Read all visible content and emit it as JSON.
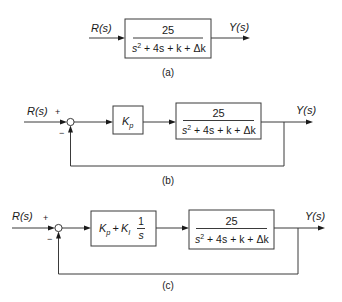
{
  "figure": {
    "panels": [
      {
        "id": "a",
        "caption": "(a)",
        "input_label": "R(s)",
        "output_label": "Y(s)",
        "plant": {
          "numerator": "25",
          "denominator": "s² + 4s + k + Δk"
        }
      },
      {
        "id": "b",
        "caption": "(b)",
        "input_label": "R(s)",
        "output_label": "Y(s)",
        "sum_signs": {
          "plus": "+",
          "minus": "−"
        },
        "controller": {
          "label": "Kp",
          "base": "K",
          "sub": "p"
        },
        "plant": {
          "numerator": "25",
          "denominator": "s² + 4s + k + Δk"
        }
      },
      {
        "id": "c",
        "caption": "(c)",
        "input_label": "R(s)",
        "output_label": "Y(s)",
        "sum_signs": {
          "plus": "+",
          "minus": "−"
        },
        "controller": {
          "label": "Kp + Ki 1/s",
          "kp_base": "K",
          "kp_sub": "p",
          "plus": "+",
          "ki_base": "K",
          "ki_sub": "I",
          "frac_num": "1",
          "frac_den": "s"
        },
        "plant": {
          "numerator": "25",
          "denominator": "s² + 4s + k + Δk"
        }
      }
    ]
  },
  "den_parts": {
    "s": "s",
    "sup": "2",
    "rest": " + 4s + k + Δk"
  }
}
